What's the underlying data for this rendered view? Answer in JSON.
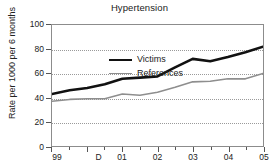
{
  "chart_data": {
    "type": "line",
    "title": "Hypertension",
    "xlabel": "",
    "ylabel": "Rate per 1000 per 6 months",
    "x_tick_labels": [
      "99",
      "D",
      "01",
      "02",
      "03",
      "04",
      "05"
    ],
    "y_tick_labels": [
      "0",
      "20",
      "40",
      "60",
      "80",
      "100"
    ],
    "y_ticks": [
      0,
      20,
      40,
      60,
      80,
      100
    ],
    "ylim": [
      0,
      100
    ],
    "xlim": [
      0,
      12
    ],
    "grid": "horizontal-dotted",
    "legend_position": "top-left-inside",
    "x": [
      0,
      1,
      2,
      3,
      4,
      5,
      6,
      7,
      8,
      9,
      10,
      11,
      12
    ],
    "series": [
      {
        "name": "Victims",
        "color": "#111111",
        "width": 2.6,
        "values": [
          43,
          46,
          48,
          51,
          55.5,
          56.5,
          57.5,
          65,
          72,
          70,
          73.5,
          77.5,
          82
        ]
      },
      {
        "name": "References",
        "color": "#8e8e8e",
        "width": 1.6,
        "values": [
          37,
          38.5,
          39,
          39,
          43,
          42,
          44.5,
          48.5,
          53,
          53.5,
          55.5,
          55.5,
          60
        ]
      }
    ]
  },
  "legend": {
    "items": [
      {
        "label": "Victims",
        "swatch": "victims-line-swatch"
      },
      {
        "label": "References",
        "swatch": "references-line-swatch"
      }
    ]
  }
}
